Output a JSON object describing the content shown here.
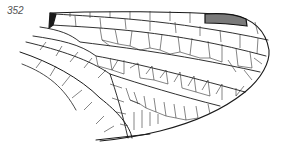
{
  "figure": {
    "label": "352",
    "colors": {
      "background": "#ffffff",
      "vein": "#1a1a1a",
      "cell_vein": "#333333",
      "pterostigma_fill": "#7a7a7a",
      "label": "#555555"
    }
  }
}
